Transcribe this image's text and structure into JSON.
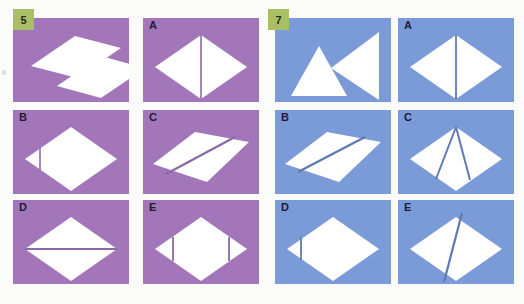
{
  "page": {
    "background": "#fbfbf9",
    "type": "paper-folding-puzzle-worksheet"
  },
  "panels": [
    {
      "id": "panel-5",
      "question_number": "5",
      "badge_color": "#a8bf63",
      "cell_color": "#a276b8",
      "shape_color": "#ffffff",
      "line_color": "#8b6aa8",
      "cells": [
        {
          "id": "q5-prompt",
          "label": "5",
          "label_visible": false,
          "description": "two separated white parallelogram halves offset diagonally",
          "shapes": [
            {
              "type": "polygon",
              "points": "18,48 62,18 108,30 64,60"
            },
            {
              "type": "polygon",
              "points": "44,68 88,38 132,50 88,80"
            }
          ],
          "lines": []
        },
        {
          "id": "q5-option-a",
          "label": "A",
          "label_visible": true,
          "description": "rhombus with a vertical line right of center",
          "shapes": [
            {
              "type": "polygon",
              "points": "12,49 58,17 104,49 58,81"
            }
          ],
          "lines": [
            {
              "x1": 58,
              "y1": 17,
              "x2": 58,
              "y2": 81,
              "width": 1.6
            }
          ]
        },
        {
          "id": "q5-option-b",
          "label": "B",
          "label_visible": true,
          "description": "rhombus with a short vertical line near the left point",
          "shapes": [
            {
              "type": "polygon",
              "points": "12,49 58,17 104,49 58,81"
            }
          ],
          "lines": [
            {
              "x1": 27,
              "y1": 38,
              "x2": 27,
              "y2": 60,
              "width": 1.6
            }
          ]
        },
        {
          "id": "q5-option-c",
          "label": "C",
          "label_visible": true,
          "description": "flat parallelogram divided by a diagonal line",
          "shapes": [
            {
              "type": "polygon",
              "points": "10,54 52,22 106,32 64,72"
            }
          ],
          "lines": [
            {
              "x1": 23,
              "y1": 64,
              "x2": 92,
              "y2": 27,
              "width": 2.4
            }
          ]
        },
        {
          "id": "q5-option-d",
          "label": "D",
          "label_visible": true,
          "description": "rhombus with a horizontal line through the middle",
          "shapes": [
            {
              "type": "polygon",
              "points": "12,49 58,17 104,49 58,81"
            }
          ],
          "lines": [
            {
              "x1": 12,
              "y1": 49,
              "x2": 104,
              "y2": 49,
              "width": 1.8
            }
          ]
        },
        {
          "id": "q5-option-e",
          "label": "E",
          "label_visible": true,
          "description": "rhombus with two vertical lines near left and right points",
          "shapes": [
            {
              "type": "polygon",
              "points": "12,49 58,17 104,49 58,81"
            }
          ],
          "lines": [
            {
              "x1": 30,
              "y1": 37,
              "x2": 30,
              "y2": 61,
              "width": 1.8
            },
            {
              "x1": 86,
              "y1": 37,
              "x2": 86,
              "y2": 61,
              "width": 1.8
            }
          ]
        }
      ]
    },
    {
      "id": "panel-7",
      "question_number": "7",
      "badge_color": "#a8bf63",
      "cell_color": "#7b9ad8",
      "shape_color": "#ffffff",
      "line_color": "#5f79b4",
      "cells": [
        {
          "id": "q7-prompt",
          "label": "7",
          "label_visible": false,
          "description": "two separated white triangles, one pointing up and one pointing left",
          "shapes": [
            {
              "type": "polygon",
              "points": "16,78 44,28 72,78"
            },
            {
              "type": "polygon",
              "points": "56,50 104,14 104,82"
            }
          ],
          "lines": []
        },
        {
          "id": "q7-option-a",
          "label": "A",
          "label_visible": true,
          "description": "rhombus with a vertical line through the centre",
          "shapes": [
            {
              "type": "polygon",
              "points": "12,49 58,17 104,49 58,81"
            }
          ],
          "lines": [
            {
              "x1": 58,
              "y1": 17,
              "x2": 58,
              "y2": 81,
              "width": 1.8
            }
          ]
        },
        {
          "id": "q7-option-b",
          "label": "B",
          "label_visible": true,
          "description": "flat parallelogram divided by a diagonal line",
          "shapes": [
            {
              "type": "polygon",
              "points": "10,54 52,22 106,32 64,72"
            }
          ],
          "lines": [
            {
              "x1": 23,
              "y1": 62,
              "x2": 90,
              "y2": 27,
              "width": 2.4
            }
          ]
        },
        {
          "id": "q7-option-c",
          "label": "C",
          "label_visible": true,
          "description": "rhombus with two lines converging at the top vertex forming a narrow triangle",
          "shapes": [
            {
              "type": "polygon",
              "points": "12,49 58,17 104,49 58,81"
            }
          ],
          "lines": [
            {
              "x1": 58,
              "y1": 17,
              "x2": 38,
              "y2": 69,
              "width": 2.0
            },
            {
              "x1": 58,
              "y1": 17,
              "x2": 72,
              "y2": 70,
              "width": 2.0
            }
          ]
        },
        {
          "id": "q7-option-d",
          "label": "D",
          "label_visible": true,
          "description": "rhombus with a short vertical line near the left point",
          "shapes": [
            {
              "type": "polygon",
              "points": "12,49 58,17 104,49 58,81"
            }
          ],
          "lines": [
            {
              "x1": 26,
              "y1": 37,
              "x2": 26,
              "y2": 60,
              "width": 1.8
            }
          ]
        },
        {
          "id": "q7-option-e",
          "label": "E",
          "label_visible": true,
          "description": "rhombus with a steep diagonal line from top edge to bottom vertex",
          "shapes": [
            {
              "type": "polygon",
              "points": "12,49 58,17 104,49 58,81"
            }
          ],
          "lines": [
            {
              "x1": 64,
              "y1": 13,
              "x2": 46,
              "y2": 82,
              "width": 2.2
            }
          ]
        }
      ]
    }
  ],
  "grid": {
    "cell_width": 116,
    "cell_height": 84,
    "columns": [
      13,
      143
    ],
    "columns_right": [
      275,
      398
    ],
    "rows": [
      18,
      110,
      200
    ]
  }
}
